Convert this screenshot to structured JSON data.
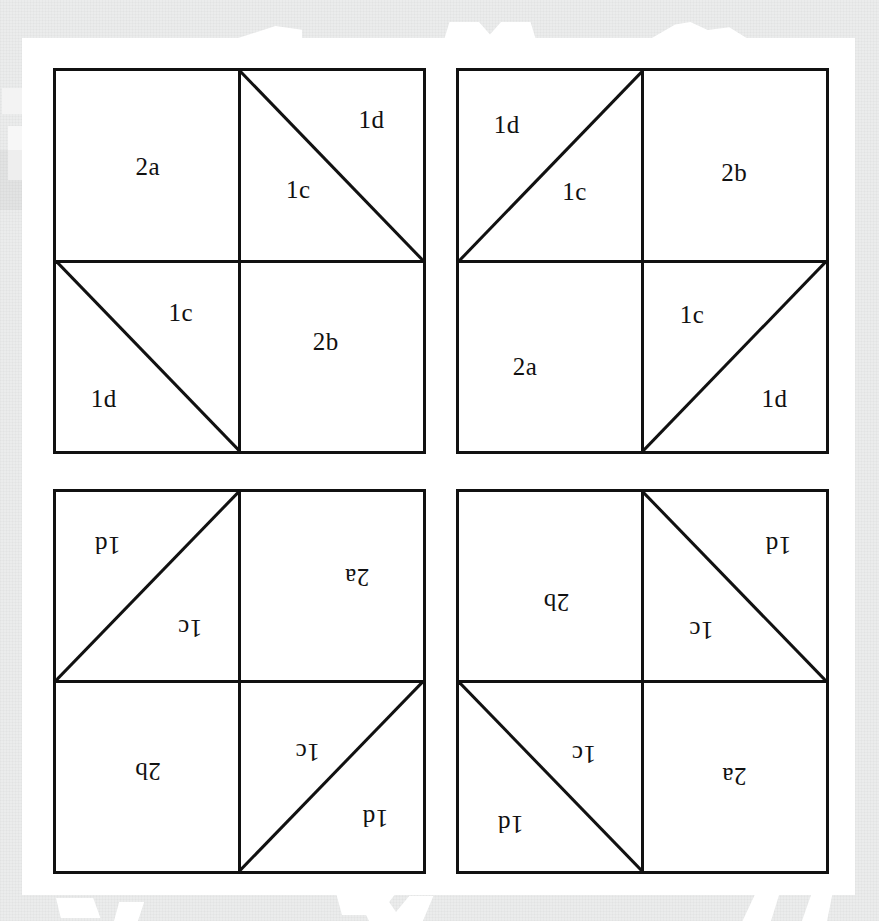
{
  "figure": {
    "ink_color": "#111111",
    "paper_color": "#ffffff",
    "scan_background_color": "#ebecec",
    "patch_labels": {
      "square_a": "2a",
      "square_b": "2b",
      "triangle_c": "1c",
      "triangle_d": "1d"
    },
    "blocks": [
      {
        "id": "block-top-left",
        "position": "top-left",
        "rotation_degrees": 0,
        "quadrants": [
          {
            "id": "tl",
            "type": "plain",
            "diagonal": "none",
            "labels": [
              {
                "text": "2a",
                "x": 50,
                "y": 50
              }
            ]
          },
          {
            "id": "tr",
            "type": "split",
            "diagonal": "tl-to-br",
            "labels": [
              {
                "text": "1d",
                "x": 72,
                "y": 25
              },
              {
                "text": "1c",
                "x": 32,
                "y": 62
              }
            ]
          },
          {
            "id": "bl",
            "type": "split",
            "diagonal": "tl-to-br",
            "labels": [
              {
                "text": "1c",
                "x": 68,
                "y": 27
              },
              {
                "text": "1d",
                "x": 26,
                "y": 72
              }
            ]
          },
          {
            "id": "br",
            "type": "plain",
            "diagonal": "none",
            "labels": [
              {
                "text": "2b",
                "x": 47,
                "y": 42
              }
            ]
          }
        ]
      },
      {
        "id": "block-top-right",
        "position": "top-right",
        "rotation_degrees": 0,
        "quadrants": [
          {
            "id": "tl",
            "type": "split",
            "diagonal": "bl-to-tr",
            "labels": [
              {
                "text": "1d",
                "x": 26,
                "y": 28
              },
              {
                "text": "1c",
                "x": 63,
                "y": 63
              }
            ]
          },
          {
            "id": "tr",
            "type": "plain",
            "diagonal": "none",
            "labels": [
              {
                "text": "2b",
                "x": 50,
                "y": 53
              }
            ]
          },
          {
            "id": "bl",
            "type": "plain",
            "diagonal": "none",
            "labels": [
              {
                "text": "2a",
                "x": 36,
                "y": 55
              }
            ]
          },
          {
            "id": "br",
            "type": "split",
            "diagonal": "bl-to-tr",
            "labels": [
              {
                "text": "1c",
                "x": 27,
                "y": 28
              },
              {
                "text": "1d",
                "x": 72,
                "y": 72
              }
            ]
          }
        ]
      },
      {
        "id": "block-bottom-left",
        "position": "bottom-left",
        "rotation_degrees": 180,
        "quadrants": [
          {
            "id": "tl",
            "type": "split",
            "diagonal": "bl-to-tr",
            "labels": [
              {
                "text": "1d",
                "x": 26,
                "y": 28
              },
              {
                "text": "1c",
                "x": 63,
                "y": 63
              }
            ]
          },
          {
            "id": "tr",
            "type": "plain",
            "diagonal": "none",
            "labels": [
              {
                "text": "2b",
                "x": 50,
                "y": 53
              }
            ]
          },
          {
            "id": "bl",
            "type": "plain",
            "diagonal": "none",
            "labels": [
              {
                "text": "2a",
                "x": 36,
                "y": 55
              }
            ]
          },
          {
            "id": "br",
            "type": "split",
            "diagonal": "bl-to-tr",
            "labels": [
              {
                "text": "1c",
                "x": 27,
                "y": 28
              },
              {
                "text": "1d",
                "x": 72,
                "y": 72
              }
            ]
          }
        ]
      },
      {
        "id": "block-bottom-right",
        "position": "bottom-right",
        "rotation_degrees": 180,
        "quadrants": [
          {
            "id": "tl",
            "type": "plain",
            "diagonal": "none",
            "labels": [
              {
                "text": "2a",
                "x": 50,
                "y": 50
              }
            ]
          },
          {
            "id": "tr",
            "type": "split",
            "diagonal": "tl-to-br",
            "labels": [
              {
                "text": "1d",
                "x": 72,
                "y": 25
              },
              {
                "text": "1c",
                "x": 32,
                "y": 62
              }
            ]
          },
          {
            "id": "bl",
            "type": "split",
            "diagonal": "tl-to-br",
            "labels": [
              {
                "text": "1c",
                "x": 68,
                "y": 27
              },
              {
                "text": "1d",
                "x": 26,
                "y": 72
              }
            ]
          },
          {
            "id": "br",
            "type": "plain",
            "diagonal": "none",
            "labels": [
              {
                "text": "2b",
                "x": 47,
                "y": 42
              }
            ]
          }
        ]
      }
    ]
  }
}
